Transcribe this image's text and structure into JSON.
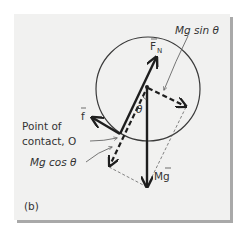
{
  "figure": {
    "panel_label": "(b)",
    "colors": {
      "background": "#ffffff",
      "card": "#f1f1f0",
      "shadow": "#a9a9a9",
      "ink": "#1e1e1e",
      "thin_ink": "#555555"
    },
    "labels": {
      "normal_force": "F",
      "normal_force_sub": "N",
      "friction": "f",
      "gravity": "Mg",
      "mg_sin": "Mg sin θ",
      "mg_cos": "Mg cos θ",
      "angle": "θ",
      "contact_line1": "Point of",
      "contact_line2": "contact, O"
    },
    "elements": {
      "circle": {
        "cx": 148,
        "cy": 89,
        "r": 52
      },
      "center_point": {
        "x": 147,
        "y": 87
      },
      "contact_point": {
        "x": 120,
        "y": 134
      },
      "vectors": [
        {
          "name": "normal-force",
          "from": [
            120,
            134
          ],
          "to": [
            156,
            57
          ],
          "style": "solid-thick"
        },
        {
          "name": "friction",
          "from": [
            120,
            134
          ],
          "to": [
            92,
            117
          ],
          "style": "solid-thick"
        },
        {
          "name": "gravity",
          "from": [
            147,
            87
          ],
          "to": [
            147,
            187
          ],
          "style": "solid-thick"
        },
        {
          "name": "mg-sin-component",
          "from": [
            147,
            87
          ],
          "to": [
            186,
            107
          ],
          "style": "dashed-thick"
        },
        {
          "name": "mg-cos-component",
          "from": [
            147,
            87
          ],
          "to": [
            109,
            167
          ],
          "style": "dashed-thick"
        }
      ]
    }
  }
}
